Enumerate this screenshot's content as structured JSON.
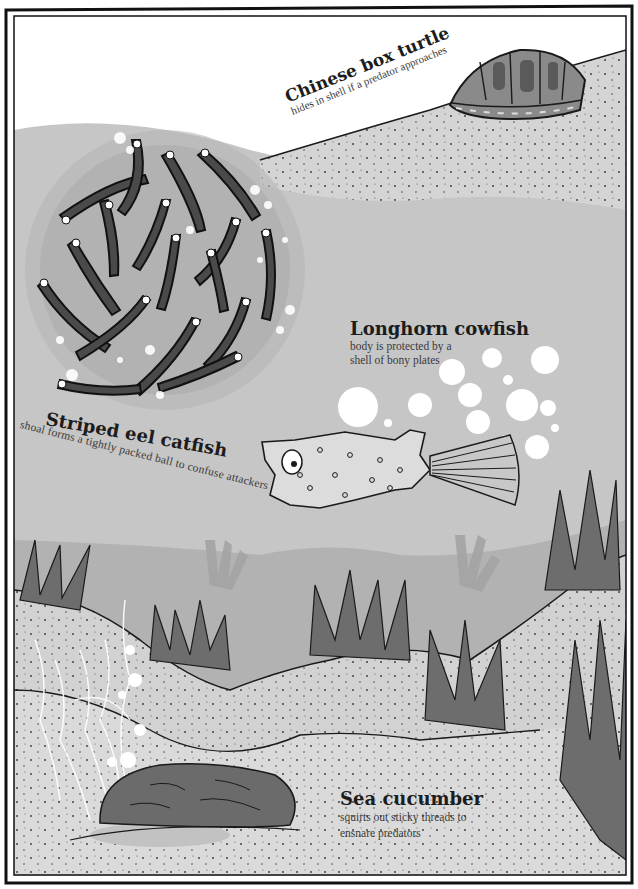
{
  "page": {
    "type": "illustrated book page",
    "palette": {
      "water": "#c7c7c7",
      "water_dark": "#b4b4b4",
      "sand": "#d6d6d6",
      "sand_light": "#dedede",
      "plant": "#6d6d6d",
      "ink": "#1a1a1a",
      "bubble": "#ffffff",
      "frame": "#111111"
    }
  },
  "animals": [
    {
      "id": "chinese-box-turtle",
      "name": "Chinese box turtle",
      "description": "hides in shell if a predator approaches"
    },
    {
      "id": "longhorn-cowfish",
      "name": "Longhorn cowfish",
      "description_lines": [
        "body is protected by a",
        "shell of bony plates"
      ]
    },
    {
      "id": "striped-eel-catfish",
      "name": "Striped eel catfish",
      "description": "shoal forms a tightly packed ball to confuse attackers"
    },
    {
      "id": "sea-cucumber",
      "name": "Sea cucumber",
      "description_lines": [
        "squirts out sticky threads to",
        "ensnare predators"
      ]
    }
  ]
}
